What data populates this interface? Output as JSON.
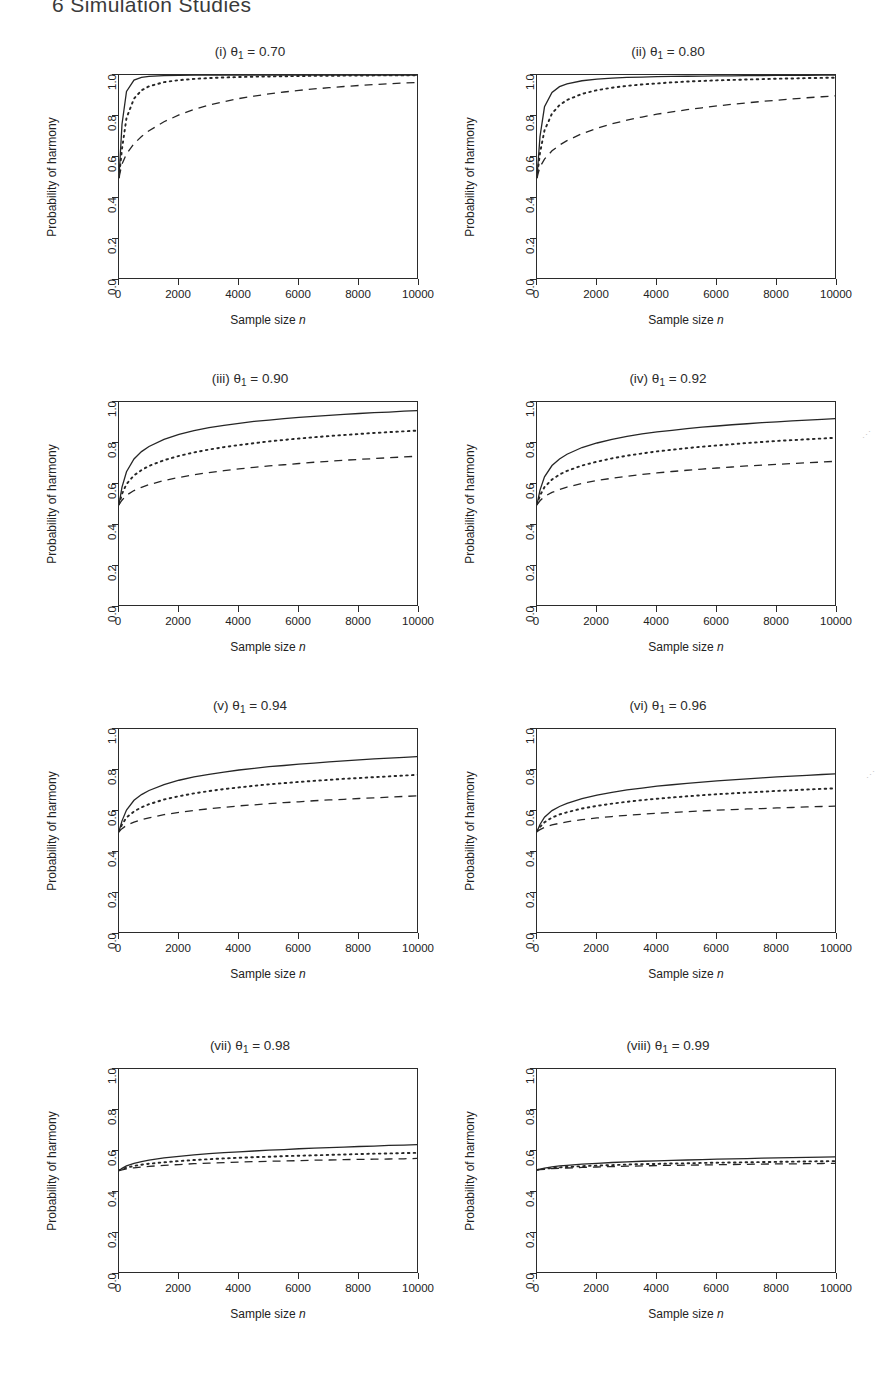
{
  "header": {
    "text": "6  Simulation Studies"
  },
  "axes": {
    "ylabel": "Probability of harmony",
    "xlabel_prefix": "Sample size ",
    "xlabel_italic": "n",
    "yticks": [
      "0.0",
      "0.2",
      "0.4",
      "0.6",
      "0.8",
      "1.0"
    ],
    "xticks": [
      "0",
      "2000",
      "4000",
      "6000",
      "8000",
      "10000"
    ],
    "ylim": [
      0.0,
      1.0
    ],
    "xlim": [
      0,
      10000
    ]
  },
  "chart_data": {
    "type": "line",
    "xlabel": "Sample size n",
    "ylabel": "Probability of harmony",
    "xlim": [
      0,
      10000
    ],
    "ylim": [
      0.0,
      1.0
    ],
    "grid": false,
    "legend": "none",
    "x": [
      0,
      100,
      250,
      500,
      750,
      1000,
      1500,
      2000,
      2500,
      3000,
      3500,
      4000,
      4500,
      5000,
      5500,
      6000,
      6500,
      7000,
      7500,
      8000,
      8500,
      9000,
      9500,
      10000
    ],
    "series_styles": [
      "solid",
      "dotted",
      "dashed"
    ],
    "panels": [
      {
        "key": "i",
        "label": "(i)",
        "theta": "0.70",
        "title_plain": "(i) θ1 = 0.70",
        "series": [
          {
            "name": "solid",
            "style": "solid",
            "values": [
              0.5,
              0.76,
              0.92,
              0.975,
              0.988,
              0.993,
              0.997,
              0.998,
              0.999,
              0.999,
              1.0,
              1.0,
              1.0,
              1.0,
              1.0,
              1.0,
              1.0,
              1.0,
              1.0,
              1.0,
              1.0,
              1.0,
              1.0,
              1.0
            ]
          },
          {
            "name": "dotted",
            "style": "dotted",
            "values": [
              0.5,
              0.64,
              0.79,
              0.885,
              0.925,
              0.945,
              0.965,
              0.975,
              0.981,
              0.985,
              0.988,
              0.99,
              0.992,
              0.993,
              0.994,
              0.995,
              0.996,
              0.996,
              0.997,
              0.997,
              0.998,
              0.998,
              0.998,
              0.999
            ]
          },
          {
            "name": "dashed",
            "style": "dashed",
            "values": [
              0.5,
              0.565,
              0.615,
              0.665,
              0.7,
              0.728,
              0.772,
              0.805,
              0.832,
              0.853,
              0.87,
              0.885,
              0.897,
              0.908,
              0.917,
              0.925,
              0.932,
              0.938,
              0.944,
              0.949,
              0.953,
              0.957,
              0.961,
              0.964
            ]
          }
        ]
      },
      {
        "key": "ii",
        "label": "(ii)",
        "theta": "0.80",
        "title_plain": "(ii) θ1 = 0.80",
        "series": [
          {
            "name": "solid",
            "style": "solid",
            "values": [
              0.5,
              0.7,
              0.845,
              0.915,
              0.943,
              0.957,
              0.972,
              0.98,
              0.985,
              0.988,
              0.99,
              0.992,
              0.993,
              0.994,
              0.995,
              0.996,
              0.996,
              0.997,
              0.997,
              0.998,
              0.998,
              0.998,
              0.999,
              0.999
            ]
          },
          {
            "name": "dotted",
            "style": "dotted",
            "values": [
              0.5,
              0.62,
              0.73,
              0.812,
              0.853,
              0.878,
              0.908,
              0.926,
              0.938,
              0.947,
              0.954,
              0.959,
              0.964,
              0.968,
              0.971,
              0.974,
              0.976,
              0.978,
              0.98,
              0.982,
              0.983,
              0.985,
              0.986,
              0.987
            ]
          },
          {
            "name": "dashed",
            "style": "dashed",
            "values": [
              0.5,
              0.552,
              0.59,
              0.63,
              0.658,
              0.68,
              0.714,
              0.74,
              0.762,
              0.78,
              0.795,
              0.809,
              0.82,
              0.831,
              0.84,
              0.849,
              0.857,
              0.864,
              0.871,
              0.877,
              0.883,
              0.889,
              0.894,
              0.899
            ]
          }
        ]
      },
      {
        "key": "iii",
        "label": "(iii)",
        "theta": "0.90",
        "title_plain": "(iii) θ1 = 0.90",
        "series": [
          {
            "name": "solid",
            "style": "solid",
            "values": [
              0.5,
              0.585,
              0.66,
              0.722,
              0.758,
              0.783,
              0.818,
              0.842,
              0.86,
              0.875,
              0.886,
              0.896,
              0.905,
              0.912,
              0.919,
              0.925,
              0.93,
              0.935,
              0.94,
              0.944,
              0.948,
              0.951,
              0.955,
              0.958
            ]
          },
          {
            "name": "dotted",
            "style": "dotted",
            "values": [
              0.5,
              0.552,
              0.6,
              0.642,
              0.668,
              0.688,
              0.716,
              0.737,
              0.754,
              0.768,
              0.78,
              0.79,
              0.799,
              0.808,
              0.815,
              0.822,
              0.828,
              0.834,
              0.839,
              0.844,
              0.849,
              0.853,
              0.857,
              0.861
            ]
          },
          {
            "name": "dashed",
            "style": "dashed",
            "values": [
              0.5,
              0.521,
              0.545,
              0.568,
              0.584,
              0.597,
              0.617,
              0.632,
              0.645,
              0.656,
              0.665,
              0.674,
              0.681,
              0.688,
              0.694,
              0.7,
              0.706,
              0.711,
              0.716,
              0.72,
              0.724,
              0.728,
              0.732,
              0.736
            ]
          }
        ]
      },
      {
        "key": "iv",
        "label": "(iv)",
        "theta": "0.92",
        "title_plain": "(iv) θ1 = 0.92",
        "series": [
          {
            "name": "solid",
            "style": "solid",
            "values": [
              0.5,
              0.57,
              0.635,
              0.69,
              0.722,
              0.745,
              0.778,
              0.8,
              0.818,
              0.832,
              0.844,
              0.854,
              0.862,
              0.87,
              0.877,
              0.883,
              0.889,
              0.894,
              0.899,
              0.903,
              0.908,
              0.912,
              0.915,
              0.919
            ]
          },
          {
            "name": "dotted",
            "style": "dotted",
            "values": [
              0.5,
              0.544,
              0.585,
              0.622,
              0.646,
              0.664,
              0.69,
              0.709,
              0.725,
              0.738,
              0.749,
              0.759,
              0.767,
              0.775,
              0.782,
              0.788,
              0.794,
              0.8,
              0.805,
              0.81,
              0.814,
              0.818,
              0.822,
              0.826
            ]
          },
          {
            "name": "dashed",
            "style": "dashed",
            "values": [
              0.5,
              0.518,
              0.539,
              0.559,
              0.573,
              0.585,
              0.603,
              0.617,
              0.628,
              0.638,
              0.647,
              0.654,
              0.661,
              0.667,
              0.673,
              0.678,
              0.683,
              0.688,
              0.692,
              0.696,
              0.7,
              0.704,
              0.707,
              0.711
            ]
          }
        ]
      },
      {
        "key": "v",
        "label": "(v)",
        "theta": "0.94",
        "title_plain": "(v) θ1 = 0.94",
        "series": [
          {
            "name": "solid",
            "style": "solid",
            "values": [
              0.5,
              0.552,
              0.605,
              0.652,
              0.68,
              0.7,
              0.729,
              0.75,
              0.766,
              0.779,
              0.79,
              0.8,
              0.808,
              0.816,
              0.822,
              0.829,
              0.834,
              0.84,
              0.845,
              0.849,
              0.854,
              0.858,
              0.862,
              0.866
            ]
          },
          {
            "name": "dotted",
            "style": "dotted",
            "values": [
              0.5,
              0.534,
              0.568,
              0.598,
              0.618,
              0.633,
              0.656,
              0.672,
              0.686,
              0.697,
              0.707,
              0.715,
              0.723,
              0.73,
              0.736,
              0.742,
              0.747,
              0.752,
              0.757,
              0.761,
              0.765,
              0.769,
              0.773,
              0.777
            ]
          },
          {
            "name": "dashed",
            "style": "dashed",
            "values": [
              0.5,
              0.514,
              0.53,
              0.546,
              0.558,
              0.567,
              0.582,
              0.593,
              0.603,
              0.611,
              0.618,
              0.625,
              0.63,
              0.636,
              0.641,
              0.645,
              0.65,
              0.654,
              0.657,
              0.661,
              0.664,
              0.668,
              0.671,
              0.674
            ]
          }
        ]
      },
      {
        "key": "vi",
        "label": "(vi)",
        "theta": "0.96",
        "title_plain": "(vi) θ1 = 0.96",
        "series": [
          {
            "name": "solid",
            "style": "solid",
            "values": [
              0.5,
              0.534,
              0.57,
              0.602,
              0.622,
              0.637,
              0.66,
              0.677,
              0.691,
              0.703,
              0.712,
              0.721,
              0.728,
              0.735,
              0.741,
              0.747,
              0.752,
              0.757,
              0.762,
              0.766,
              0.77,
              0.774,
              0.778,
              0.781
            ]
          },
          {
            "name": "dotted",
            "style": "dotted",
            "values": [
              0.5,
              0.522,
              0.545,
              0.568,
              0.583,
              0.594,
              0.612,
              0.625,
              0.636,
              0.645,
              0.653,
              0.66,
              0.666,
              0.672,
              0.677,
              0.682,
              0.686,
              0.69,
              0.694,
              0.698,
              0.701,
              0.705,
              0.708,
              0.711
            ]
          },
          {
            "name": "dashed",
            "style": "dashed",
            "values": [
              0.5,
              0.509,
              0.52,
              0.532,
              0.54,
              0.547,
              0.558,
              0.566,
              0.573,
              0.579,
              0.584,
              0.589,
              0.593,
              0.597,
              0.6,
              0.604,
              0.607,
              0.61,
              0.612,
              0.615,
              0.617,
              0.62,
              0.622,
              0.624
            ]
          }
        ]
      },
      {
        "key": "vii",
        "label": "(vii)",
        "theta": "0.98",
        "title_plain": "(vii) θ1 = 0.98",
        "series": [
          {
            "name": "solid",
            "style": "solid",
            "values": [
              0.505,
              0.515,
              0.527,
              0.54,
              0.548,
              0.555,
              0.566,
              0.574,
              0.581,
              0.587,
              0.592,
              0.596,
              0.6,
              0.604,
              0.607,
              0.611,
              0.614,
              0.616,
              0.619,
              0.622,
              0.624,
              0.627,
              0.629,
              0.631
            ]
          },
          {
            "name": "dotted",
            "style": "dotted",
            "values": [
              0.505,
              0.511,
              0.519,
              0.527,
              0.533,
              0.538,
              0.545,
              0.551,
              0.556,
              0.56,
              0.564,
              0.567,
              0.57,
              0.572,
              0.575,
              0.577,
              0.579,
              0.581,
              0.583,
              0.585,
              0.587,
              0.588,
              0.59,
              0.591
            ]
          },
          {
            "name": "dashed",
            "style": "dashed",
            "values": [
              0.505,
              0.508,
              0.513,
              0.518,
              0.522,
              0.525,
              0.53,
              0.534,
              0.538,
              0.541,
              0.543,
              0.546,
              0.548,
              0.55,
              0.551,
              0.553,
              0.555,
              0.556,
              0.558,
              0.559,
              0.56,
              0.561,
              0.562,
              0.564
            ]
          }
        ]
      },
      {
        "key": "viii",
        "label": "(viii)",
        "theta": "0.99",
        "title_plain": "(viii) θ1 = 0.99",
        "series": [
          {
            "name": "solid",
            "style": "solid",
            "values": [
              0.508,
              0.512,
              0.517,
              0.523,
              0.527,
              0.53,
              0.536,
              0.54,
              0.544,
              0.547,
              0.55,
              0.552,
              0.554,
              0.556,
              0.558,
              0.56,
              0.562,
              0.563,
              0.565,
              0.566,
              0.568,
              0.569,
              0.57,
              0.572
            ]
          },
          {
            "name": "dotted",
            "style": "dotted",
            "values": [
              0.508,
              0.51,
              0.513,
              0.517,
              0.52,
              0.522,
              0.526,
              0.529,
              0.531,
              0.534,
              0.536,
              0.537,
              0.539,
              0.54,
              0.542,
              0.543,
              0.544,
              0.545,
              0.546,
              0.547,
              0.548,
              0.549,
              0.55,
              0.551
            ]
          },
          {
            "name": "dashed",
            "style": "dashed",
            "values": [
              0.508,
              0.509,
              0.511,
              0.514,
              0.516,
              0.517,
              0.52,
              0.522,
              0.524,
              0.526,
              0.527,
              0.529,
              0.53,
              0.531,
              0.532,
              0.533,
              0.534,
              0.535,
              0.536,
              0.537,
              0.537,
              0.538,
              0.539,
              0.54
            ]
          }
        ]
      }
    ]
  }
}
